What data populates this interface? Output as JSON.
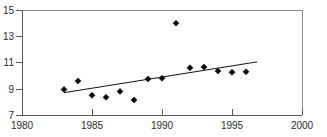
{
  "figure": {
    "background_color": "#ffffff",
    "axis_color": "#5a5a5a",
    "frame_color": "#8a8a8a",
    "marker_color": "#0a0a0a",
    "trend_color": "#111111",
    "cropped_caption": ""
  },
  "chart_data": {
    "type": "scatter",
    "title": "",
    "subtitle": "",
    "xlabel": "",
    "ylabel": "",
    "xlim": [
      1980,
      2000
    ],
    "ylim": [
      7,
      15
    ],
    "xticks": [
      1980,
      1985,
      1990,
      1995,
      2000
    ],
    "yticks": [
      7,
      9,
      11,
      13,
      15
    ],
    "xtick_labels": [
      "1980",
      "1985",
      "1990",
      "1995",
      "2000"
    ],
    "ytick_labels": [
      "7",
      "9",
      "11",
      "13",
      "15"
    ],
    "grid": false,
    "legend": null,
    "legend_position": "none",
    "marker_style": "diamond",
    "x": [
      1983,
      1984,
      1985,
      1986,
      1987,
      1988,
      1989,
      1990,
      1991,
      1992,
      1993,
      1994,
      1995,
      1996
    ],
    "values": [
      8.95,
      9.6,
      8.5,
      8.35,
      8.8,
      8.15,
      9.75,
      9.8,
      14.0,
      10.6,
      10.65,
      10.35,
      10.25,
      10.3
    ],
    "series": [
      {
        "name": "observations",
        "type": "scatter",
        "x": [
          1983,
          1984,
          1985,
          1986,
          1987,
          1988,
          1989,
          1990,
          1991,
          1992,
          1993,
          1994,
          1995,
          1996
        ],
        "values": [
          8.95,
          9.6,
          8.5,
          8.35,
          8.8,
          8.15,
          9.75,
          9.8,
          14.0,
          10.6,
          10.65,
          10.35,
          10.25,
          10.3
        ]
      },
      {
        "name": "trend-line",
        "type": "line",
        "x": [
          1983.0,
          1996.8
        ],
        "values": [
          8.7,
          11.05
        ]
      }
    ],
    "annotations": [
      {
        "label": "outlier",
        "x": 1991,
        "y": 14.0
      }
    ]
  }
}
